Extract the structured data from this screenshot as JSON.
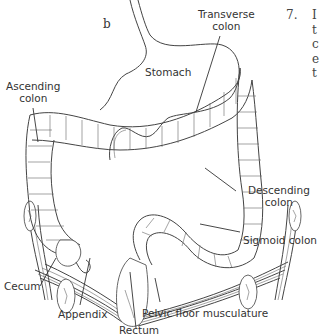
{
  "figure": {
    "panel_letter": "b",
    "labels": {
      "transverse_colon": [
        "Transverse",
        "colon"
      ],
      "stomach": "Stomach",
      "ascending_colon": [
        "Ascending",
        "colon"
      ],
      "descending_colon": [
        "Descending",
        "colon"
      ],
      "sigmoid_colon": "Sigmoid colon",
      "cecum": "Cecum",
      "appendix": "Appendix",
      "pelvic_floor": "Pelvic floor musculature",
      "rectum": "Rectum"
    }
  },
  "side_text": {
    "item_number": "7.",
    "line_starts": [
      "I",
      "t",
      "c",
      "e",
      "t"
    ]
  }
}
